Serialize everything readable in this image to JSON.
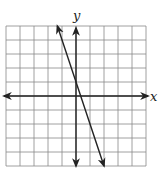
{
  "chart_data": {
    "type": "line",
    "title": "",
    "xlabel": "x",
    "ylabel": "y",
    "xlim": [
      -5,
      5
    ],
    "ylim": [
      -5,
      5
    ],
    "grid": true,
    "grid_step": 1,
    "series": [
      {
        "name": "line",
        "equation": "y = -3x + 1",
        "slope": -3,
        "intercept": 1,
        "x": [
          -1.33,
          2.0
        ],
        "y": [
          5.0,
          -5.0
        ],
        "arrows": "both"
      }
    ],
    "colors": {
      "grid": "#888888",
      "axes": "#222222",
      "line": "#222222"
    }
  }
}
